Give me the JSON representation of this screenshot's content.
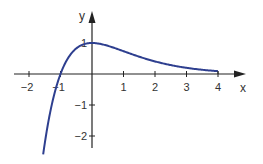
{
  "chart_data": {
    "type": "line",
    "title": "",
    "xlabel": "x",
    "ylabel": "y",
    "xlim": [
      -2.3,
      4.6
    ],
    "ylim": [
      -2.5,
      1.9
    ],
    "x_ticks": [
      -2,
      -1,
      1,
      2,
      3,
      4
    ],
    "x_tick_labels": [
      "−2",
      "−1",
      "1",
      "2",
      "3",
      "4"
    ],
    "y_ticks": [
      1,
      -1,
      -2
    ],
    "y_tick_labels": [
      "1",
      "−1",
      "−2"
    ],
    "grid": false,
    "legend": "none",
    "series": [
      {
        "name": "f(x) = (1 + x)·e^(−x)",
        "color": "#2e3f8f",
        "domain": [
          -1.55,
          4
        ],
        "x": [
          -1.55,
          -1.5,
          -1.4,
          -1.3,
          -1.2,
          -1.1,
          -1.0,
          -0.8,
          -0.6,
          -0.4,
          -0.2,
          0,
          0.25,
          0.5,
          0.75,
          1.0,
          1.5,
          2.0,
          2.5,
          3.0,
          3.5,
          4.0
        ],
        "y": [
          -2.6,
          -2.24,
          -1.62,
          -1.1,
          -0.66,
          -0.3,
          0,
          0.45,
          0.73,
          0.9,
          0.98,
          1.0,
          0.97,
          0.91,
          0.83,
          0.74,
          0.56,
          0.41,
          0.29,
          0.2,
          0.14,
          0.09
        ]
      }
    ]
  },
  "colors": {
    "axis": "#222222",
    "curve": "#2e3f8f"
  }
}
